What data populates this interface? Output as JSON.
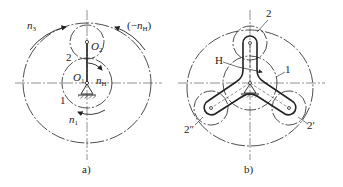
{
  "figure_a": {
    "caption": "a)",
    "labels": {
      "n3": "n",
      "n3_sub": "3",
      "neg_nH_open": "(−",
      "neg_nH": "n",
      "neg_nH_sub": "H",
      "neg_nH_close": ")",
      "gear2": "2",
      "O2": "O",
      "O2_sub": "2",
      "O1": "O",
      "O1_sub": "1",
      "nH": "n",
      "nH_sub": "H",
      "gear1": "1",
      "n1": "n",
      "n1_sub": "1"
    }
  },
  "figure_b": {
    "caption": "b)",
    "labels": {
      "planet2": "2",
      "carrier": "H",
      "sun1": "1",
      "planet2_double": "2″",
      "planet2_prime": "2′"
    }
  },
  "colors": {
    "line": "#222222",
    "background": "#ffffff"
  }
}
